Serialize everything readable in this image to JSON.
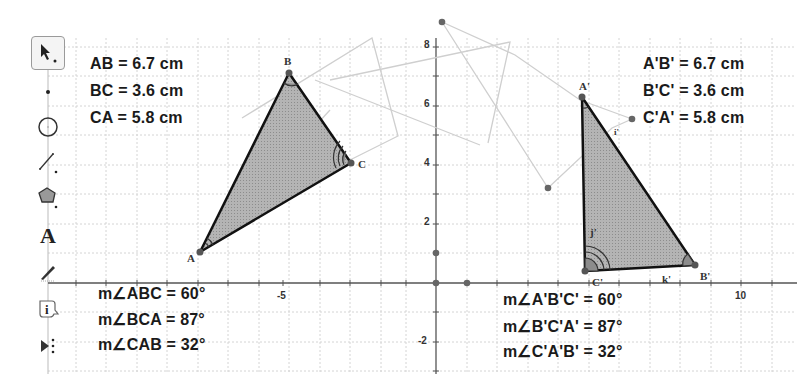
{
  "toolbar": {
    "tools": [
      {
        "name": "move-tool",
        "icon": "arrow-cursor-icon",
        "selected": true
      },
      {
        "name": "point-tool",
        "icon": "point-icon"
      },
      {
        "name": "circle-tool",
        "icon": "circle-icon"
      },
      {
        "name": "line-tool",
        "icon": "line-icon"
      },
      {
        "name": "polygon-tool",
        "icon": "pentagon-icon"
      },
      {
        "name": "text-tool",
        "icon": "text-A-icon",
        "glyph": "A"
      },
      {
        "name": "pen-tool",
        "icon": "pen-icon"
      },
      {
        "name": "info-tool",
        "icon": "info-icon",
        "glyph": "i"
      },
      {
        "name": "more-tools",
        "icon": "more-tools-icon"
      }
    ]
  },
  "measurements_original": {
    "AB": "AB = 6.7 cm",
    "BC": "BC = 3.6 cm",
    "CA": "CA = 5.8 cm"
  },
  "measurements_image": {
    "AB": "A'B' = 6.7 cm",
    "BC": "B'C' = 3.6 cm",
    "CA": "C'A' = 5.8 cm"
  },
  "angles_original": {
    "ABC": "m∠ABC = 60°",
    "BCA": "m∠BCA = 87°",
    "CAB": "m∠CAB = 32°"
  },
  "angles_image": {
    "ABC": "m∠A'B'C' = 60°",
    "BCA": "m∠B'C'A' = 87°",
    "CAB": "m∠C'A'B' = 32°"
  },
  "points": {
    "A": "A",
    "B": "B",
    "C": "C",
    "A1": "A'",
    "B1": "B'",
    "C1": "C'",
    "j1": "j'",
    "k1": "k'",
    "i1": "i'"
  },
  "axes": {
    "y_ticks": [
      "8",
      "6",
      "4",
      "2",
      "-2"
    ],
    "x_ticks": [
      "-5",
      "10"
    ]
  },
  "colors": {
    "triangle_fill": "#a9a9a9",
    "triangle_stroke": "#111111",
    "grid": "#d6d6d6",
    "ghost": "#c8c8c8"
  }
}
